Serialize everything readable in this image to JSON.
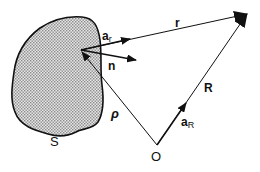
{
  "figure": {
    "region_label": "S",
    "origin_label": "O",
    "vectors": {
      "r": {
        "label": "r"
      },
      "R": {
        "label": "R"
      },
      "rho": {
        "label": "ρ"
      },
      "n": {
        "label": "n"
      },
      "a_r": {
        "label": "a",
        "subscript": "r"
      },
      "a_R": {
        "label": "a",
        "subscript": "R"
      }
    },
    "colors": {
      "ink": "#111111",
      "region_fill": "#d4d4d4",
      "background": "#ffffff"
    }
  }
}
